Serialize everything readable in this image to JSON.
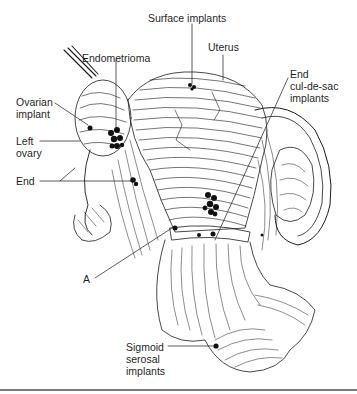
{
  "figure": {
    "type": "anatomical-illustration",
    "labels": {
      "surface_implants": "Surface implants",
      "uterus": "Uterus",
      "endometrioma": "Endometrioma",
      "end_cul_de_sac_line1": "End",
      "end_cul_de_sac_line2": "cul-de-sac",
      "end_cul_de_sac_line3": "implants",
      "ovarian_implant_line1": "Ovarian",
      "ovarian_implant_line2": "implant",
      "left_ovary_line1": "Left",
      "left_ovary_line2": "ovary",
      "end": "End",
      "a": "A",
      "sigmoid_line1": "Sigmoid",
      "sigmoid_line2": "serosal",
      "sigmoid_line3": "implants"
    },
    "colors": {
      "ink": "#1a1a1a",
      "lesion": "#111111",
      "background": "#ffffff",
      "divider": "#7a7a7a"
    }
  }
}
